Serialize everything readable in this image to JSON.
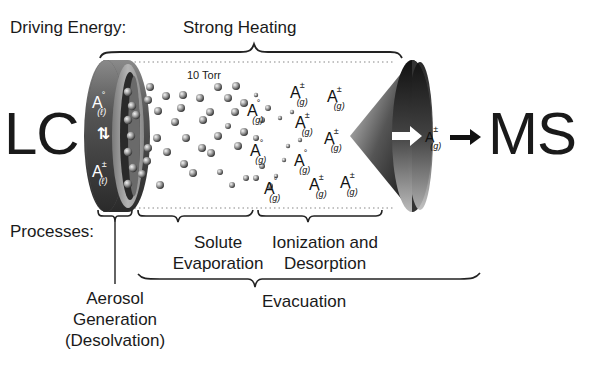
{
  "header": {
    "driving_energy_label": "Driving Energy:",
    "driving_energy_value": "Strong Heating"
  },
  "ends": {
    "left": "LC",
    "right": "MS"
  },
  "chamber": {
    "pressure_label": "10 Torr"
  },
  "species": {
    "liquid_neutral": {
      "base": "A",
      "sup": "°",
      "sub": "(ℓ)"
    },
    "equilibrium": "⇅",
    "liquid_ion": {
      "base": "A",
      "sup": "±",
      "sub": "(ℓ)"
    },
    "gas_neutral": {
      "base": "A",
      "sup": "°",
      "sub": "(g)"
    },
    "gas_ion": {
      "base": "A",
      "sup": "±",
      "sub": "(g)"
    }
  },
  "processes": {
    "label": "Processes:",
    "aerosol_line1": "Aerosol",
    "aerosol_line2": "Generation",
    "aerosol_line3": "(Desolvation)",
    "solute_line1": "Solute",
    "solute_line2": "Evaporation",
    "ionization_line1": "Ionization and",
    "ionization_line2": "Desorption",
    "evacuation": "Evacuation"
  },
  "colors": {
    "text": "#1a1a1a",
    "cylinder_dark": "#3a3a3a",
    "cylinder_light": "#9a9a9a",
    "background": "#ffffff"
  }
}
